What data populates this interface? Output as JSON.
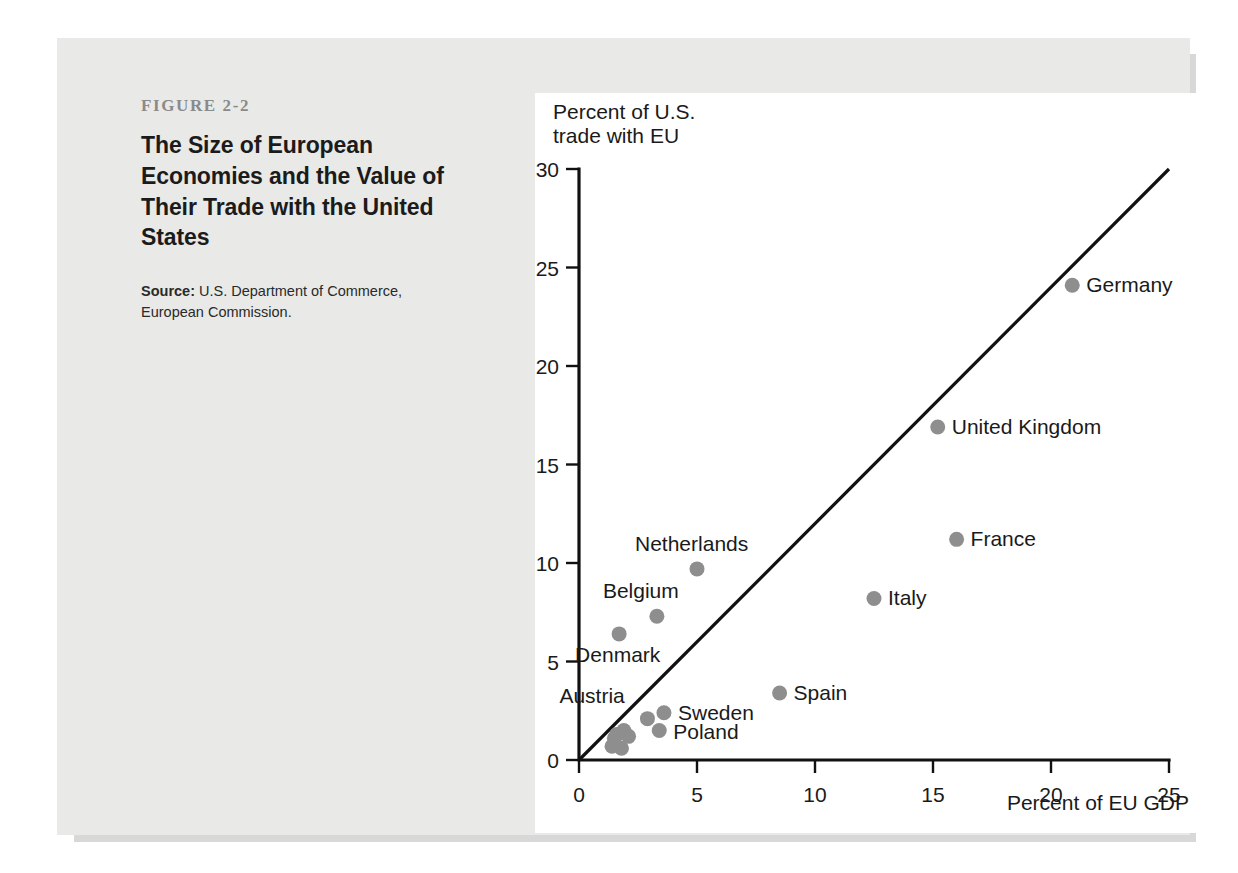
{
  "caption": {
    "kicker": "FIGURE 2-2",
    "title": "The Size of European Economies and the Value of Their Trade with the United States",
    "source_label": "Source:",
    "source_text": " U.S. Department of Commerce, European Commission."
  },
  "colors": {
    "page_background": "#ffffff",
    "panel_background": "#e9e9e7",
    "chart_background": "#ffffff",
    "dot_color": "#8e8e8e",
    "axis_color": "#111111",
    "kicker_color": "#8a8a8a",
    "title_color": "#1b1b1b"
  },
  "chart_data": {
    "type": "scatter",
    "title": "",
    "xlabel": "Percent of EU GDP",
    "ylabel": "Percent of U.S. trade with EU",
    "xlim": [
      0,
      25
    ],
    "ylim": [
      0,
      30
    ],
    "xticks": [
      0,
      5,
      10,
      15,
      20,
      25
    ],
    "yticks": [
      0,
      5,
      10,
      15,
      20,
      25,
      30
    ],
    "grid": false,
    "legend": "none",
    "annotations": [
      {
        "name": "forty-five-degree-line",
        "type": "line",
        "from": [
          0,
          0
        ],
        "to": [
          25,
          30
        ],
        "label": ""
      }
    ],
    "points": [
      {
        "label": "Germany",
        "x": 20.9,
        "y": 24.1,
        "label_dx": 14,
        "label_dy": 7
      },
      {
        "label": "United Kingdom",
        "x": 15.2,
        "y": 16.9,
        "label_dx": 14,
        "label_dy": 7
      },
      {
        "label": "France",
        "x": 16.0,
        "y": 11.2,
        "label_dx": 14,
        "label_dy": 7
      },
      {
        "label": "Italy",
        "x": 12.5,
        "y": 8.2,
        "label_dx": 14,
        "label_dy": 7
      },
      {
        "label": "Netherlands",
        "x": 5.0,
        "y": 9.7,
        "label_dx": -62,
        "label_dy": -18
      },
      {
        "label": "Belgium",
        "x": 3.3,
        "y": 7.3,
        "label_dx": -54,
        "label_dy": -18
      },
      {
        "label": "Denmark",
        "x": 1.7,
        "y": 6.4,
        "label_dx": -44,
        "label_dy": 28
      },
      {
        "label": "Spain",
        "x": 8.5,
        "y": 3.4,
        "label_dx": 14,
        "label_dy": 7
      },
      {
        "label": "Austria",
        "x": 2.9,
        "y": 2.1,
        "label_dx": -88,
        "label_dy": -16
      },
      {
        "label": "Sweden",
        "x": 3.6,
        "y": 2.4,
        "label_dx": 14,
        "label_dy": 7
      },
      {
        "label": "Poland",
        "x": 3.4,
        "y": 1.5,
        "label_dx": 14,
        "label_dy": 9
      },
      {
        "label": "",
        "x": 2.1,
        "y": 1.2,
        "label_dx": 0,
        "label_dy": 0
      },
      {
        "label": "",
        "x": 1.9,
        "y": 1.5,
        "label_dx": 0,
        "label_dy": 0
      },
      {
        "label": "",
        "x": 1.6,
        "y": 1.3,
        "label_dx": 0,
        "label_dy": 0
      },
      {
        "label": "",
        "x": 1.5,
        "y": 1.1,
        "label_dx": 0,
        "label_dy": 0
      },
      {
        "label": "",
        "x": 1.4,
        "y": 0.7,
        "label_dx": 0,
        "label_dy": 0
      },
      {
        "label": "",
        "x": 1.8,
        "y": 0.6,
        "label_dx": 0,
        "label_dy": 0
      }
    ]
  }
}
